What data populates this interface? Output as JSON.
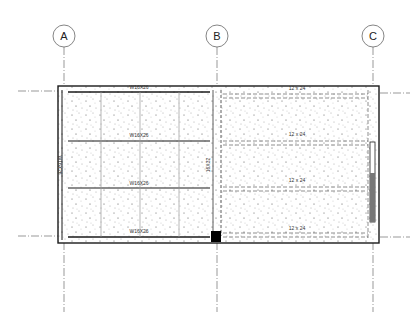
{
  "drawing": {
    "type": "structural framing plan",
    "grid_lines": [
      {
        "label": "A",
        "x": 64
      },
      {
        "label": "B",
        "x": 217
      },
      {
        "label": "C",
        "x": 373
      }
    ],
    "left_bay": {
      "beams": [
        {
          "label": "W16X26",
          "position": "top"
        },
        {
          "label": "W16X26",
          "position": "upper-middle"
        },
        {
          "label": "W16X26",
          "position": "lower-middle"
        },
        {
          "label": "W16X26",
          "position": "bottom"
        }
      ],
      "side_beam_label": "W16X26"
    },
    "center_girder_label": "16X32",
    "right_bay": {
      "joists": [
        {
          "label": "12 x 24"
        },
        {
          "label": "12 x 24"
        },
        {
          "label": "12 x 24"
        },
        {
          "label": "12 x 24"
        }
      ]
    },
    "colors": {
      "line": "#1a1a1a",
      "grid": "#555555",
      "stipple": "#444444",
      "column": "#000000",
      "wall_panel": "#777777"
    }
  }
}
